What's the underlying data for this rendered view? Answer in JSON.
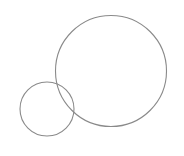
{
  "canvas": {
    "width": 184,
    "height": 156,
    "background": "#ffffff"
  },
  "shapes": [
    {
      "type": "circle",
      "name": "large-circle",
      "cx": 111,
      "cy": 71,
      "r": 55.5,
      "stroke": "#8a8a8a",
      "stroke_width": 1.1
    },
    {
      "type": "circle",
      "name": "small-circle",
      "cx": 47,
      "cy": 109,
      "r": 27,
      "stroke": "#8a8a8a",
      "stroke_width": 1.1
    }
  ]
}
